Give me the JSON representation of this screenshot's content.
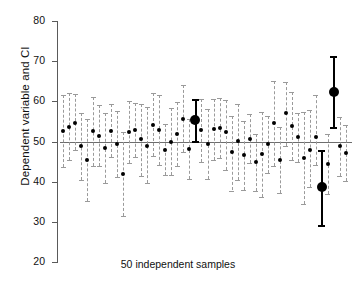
{
  "chart_data": {
    "type": "scatter",
    "title": "",
    "xlabel": "50 independent samples",
    "ylabel": "Dependent variable and CI",
    "ylim": [
      20,
      80
    ],
    "yticks": [
      20,
      30,
      40,
      50,
      60,
      70,
      80
    ],
    "ytick_labels": [
      "20",
      "30",
      "40",
      "50",
      "60",
      "70",
      "80"
    ],
    "grid": false,
    "legend": null,
    "reference_line": {
      "y": 50,
      "label": "population mean",
      "color": "#6d6d6d"
    },
    "n_samples": 50,
    "marker_color": "#000000",
    "ci_color": "#9a9a9a",
    "highlight_color": "#000000",
    "series": [
      {
        "name": "sample mean with 95% CI",
        "points": [
          {
            "i": 1,
            "mean": 52.6,
            "lo": 43.7,
            "hi": 61.5,
            "highlight": false
          },
          {
            "i": 2,
            "mean": 53.6,
            "lo": 45.5,
            "hi": 62.0,
            "highlight": false
          },
          {
            "i": 3,
            "mean": 54.5,
            "lo": 47.8,
            "hi": 61.8,
            "highlight": false
          },
          {
            "i": 4,
            "mean": 49.0,
            "lo": 40.5,
            "hi": 57.0,
            "highlight": false
          },
          {
            "i": 5,
            "mean": 45.4,
            "lo": 35.2,
            "hi": 55.6,
            "highlight": false
          },
          {
            "i": 6,
            "mean": 52.7,
            "lo": 44.0,
            "hi": 61.2,
            "highlight": false
          },
          {
            "i": 7,
            "mean": 51.4,
            "lo": 43.8,
            "hi": 59.2,
            "highlight": false
          },
          {
            "i": 8,
            "mean": 48.4,
            "lo": 39.6,
            "hi": 57.2,
            "highlight": false
          },
          {
            "i": 9,
            "mean": 52.6,
            "lo": 46.2,
            "hi": 59.3,
            "highlight": false
          },
          {
            "i": 10,
            "mean": 49.4,
            "lo": 41.2,
            "hi": 57.5,
            "highlight": false
          },
          {
            "i": 11,
            "mean": 42.0,
            "lo": 31.5,
            "hi": 52.4,
            "highlight": false
          },
          {
            "i": 12,
            "mean": 52.4,
            "lo": 44.6,
            "hi": 60.1,
            "highlight": false
          },
          {
            "i": 13,
            "mean": 52.9,
            "lo": 46.1,
            "hi": 59.6,
            "highlight": false
          },
          {
            "i": 14,
            "mean": 50.5,
            "lo": 41.5,
            "hi": 59.4,
            "highlight": false
          },
          {
            "i": 15,
            "mean": 49.0,
            "lo": 39.6,
            "hi": 58.5,
            "highlight": false
          },
          {
            "i": 16,
            "mean": 54.2,
            "lo": 46.3,
            "hi": 62.0,
            "highlight": false
          },
          {
            "i": 17,
            "mean": 52.9,
            "lo": 44.2,
            "hi": 61.6,
            "highlight": false
          },
          {
            "i": 18,
            "mean": 47.9,
            "lo": 41.6,
            "hi": 54.3,
            "highlight": false
          },
          {
            "i": 19,
            "mean": 50.0,
            "lo": 41.7,
            "hi": 58.3,
            "highlight": false
          },
          {
            "i": 20,
            "mean": 51.9,
            "lo": 43.9,
            "hi": 59.8,
            "highlight": false
          },
          {
            "i": 21,
            "mean": 55.7,
            "lo": 47.4,
            "hi": 64.0,
            "highlight": false
          },
          {
            "i": 22,
            "mean": 48.2,
            "lo": 40.7,
            "hi": 55.7,
            "highlight": false
          },
          {
            "i": 23,
            "mean": 55.4,
            "lo": 50.1,
            "hi": 60.7,
            "highlight": true
          },
          {
            "i": 24,
            "mean": 52.9,
            "lo": 45.0,
            "hi": 60.6,
            "highlight": false
          },
          {
            "i": 25,
            "mean": 49.4,
            "lo": 40.7,
            "hi": 58.0,
            "highlight": false
          },
          {
            "i": 26,
            "mean": 53.0,
            "lo": 45.3,
            "hi": 60.7,
            "highlight": false
          },
          {
            "i": 27,
            "mean": 53.3,
            "lo": 45.8,
            "hi": 60.9,
            "highlight": false
          },
          {
            "i": 28,
            "mean": 52.3,
            "lo": 43.0,
            "hi": 60.4,
            "highlight": false
          },
          {
            "i": 29,
            "mean": 47.3,
            "lo": 37.8,
            "hi": 56.4,
            "highlight": false
          },
          {
            "i": 30,
            "mean": 50.2,
            "lo": 40.5,
            "hi": 59.3,
            "highlight": false
          },
          {
            "i": 31,
            "mean": 46.6,
            "lo": 38.0,
            "hi": 55.2,
            "highlight": false
          },
          {
            "i": 32,
            "mean": 50.7,
            "lo": 44.6,
            "hi": 56.9,
            "highlight": false
          },
          {
            "i": 33,
            "mean": 44.8,
            "lo": 37.6,
            "hi": 51.9,
            "highlight": false
          },
          {
            "i": 34,
            "mean": 46.8,
            "lo": 36.3,
            "hi": 57.3,
            "highlight": false
          },
          {
            "i": 35,
            "mean": 49.3,
            "lo": 42.2,
            "hi": 56.4,
            "highlight": false
          },
          {
            "i": 36,
            "mean": 54.5,
            "lo": 44.0,
            "hi": 65.0,
            "highlight": false
          },
          {
            "i": 37,
            "mean": 45.3,
            "lo": 37.3,
            "hi": 53.5,
            "highlight": false
          },
          {
            "i": 38,
            "mean": 57.0,
            "lo": 49.0,
            "hi": 64.9,
            "highlight": false
          },
          {
            "i": 39,
            "mean": 53.9,
            "lo": 45.4,
            "hi": 62.4,
            "highlight": false
          },
          {
            "i": 40,
            "mean": 51.1,
            "lo": 45.0,
            "hi": 57.2,
            "highlight": false
          },
          {
            "i": 41,
            "mean": 46.0,
            "lo": 34.5,
            "hi": 57.3,
            "highlight": false
          },
          {
            "i": 42,
            "mean": 47.9,
            "lo": 38.7,
            "hi": 57.8,
            "highlight": false
          },
          {
            "i": 43,
            "mean": 51.2,
            "lo": 44.2,
            "hi": 61.7,
            "highlight": false
          },
          {
            "i": 44,
            "mean": 38.6,
            "lo": 29.3,
            "hi": 48.0,
            "highlight": true
          },
          {
            "i": 45,
            "mean": 44.4,
            "lo": 37.0,
            "hi": 51.9,
            "highlight": false
          },
          {
            "i": 46,
            "mean": 62.3,
            "lo": 53.5,
            "hi": 71.3,
            "highlight": true
          },
          {
            "i": 47,
            "mean": 48.9,
            "lo": 41.3,
            "hi": 56.1,
            "highlight": false
          },
          {
            "i": 48,
            "mean": 47.2,
            "lo": 40.2,
            "hi": 54.1,
            "highlight": false
          }
        ]
      }
    ]
  }
}
